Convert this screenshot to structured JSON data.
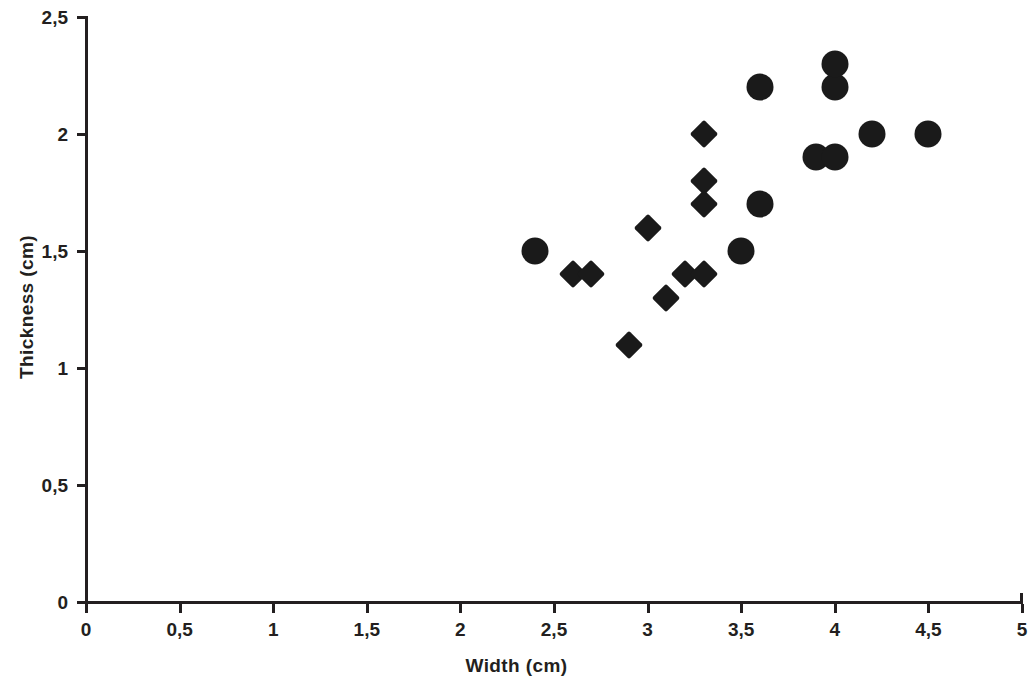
{
  "chart_data": {
    "type": "scatter",
    "title": "",
    "xlabel": "Width (cm)",
    "ylabel": "Thickness (cm)",
    "xlim": [
      0,
      5
    ],
    "ylim": [
      0,
      2.5
    ],
    "xticks": [
      "0",
      "0,5",
      "1",
      "1,5",
      "2",
      "2,5",
      "3",
      "3,5",
      "4",
      "4,5",
      "5"
    ],
    "xtick_values": [
      0,
      0.5,
      1,
      1.5,
      2,
      2.5,
      3,
      3.5,
      4,
      4.5,
      5
    ],
    "yticks": [
      "0",
      "0,5",
      "1",
      "1,5",
      "2",
      "2,5"
    ],
    "ytick_values": [
      0,
      0.5,
      1,
      1.5,
      2,
      2.5
    ],
    "grid": false,
    "legend": "none",
    "decimal_separator": ",",
    "marker_color": "#1a1a1a",
    "series": [
      {
        "name": "circle-series",
        "marker": "circle",
        "color": "#1a1a1a",
        "points": [
          {
            "x": 2.4,
            "y": 1.5
          },
          {
            "x": 3.5,
            "y": 1.5
          },
          {
            "x": 3.6,
            "y": 1.7
          },
          {
            "x": 3.6,
            "y": 2.2
          },
          {
            "x": 3.9,
            "y": 1.9
          },
          {
            "x": 4.0,
            "y": 1.9
          },
          {
            "x": 4.0,
            "y": 2.2
          },
          {
            "x": 4.0,
            "y": 2.3
          },
          {
            "x": 4.2,
            "y": 2.0
          },
          {
            "x": 4.5,
            "y": 2.0
          }
        ]
      },
      {
        "name": "diamond-series",
        "marker": "diamond",
        "color": "#1a1a1a",
        "points": [
          {
            "x": 2.6,
            "y": 1.4
          },
          {
            "x": 2.7,
            "y": 1.4
          },
          {
            "x": 2.9,
            "y": 1.1
          },
          {
            "x": 3.0,
            "y": 1.6
          },
          {
            "x": 3.1,
            "y": 1.3
          },
          {
            "x": 3.2,
            "y": 1.4
          },
          {
            "x": 3.3,
            "y": 1.4
          },
          {
            "x": 3.3,
            "y": 1.7
          },
          {
            "x": 3.3,
            "y": 1.8
          },
          {
            "x": 3.3,
            "y": 2.0
          }
        ]
      }
    ]
  }
}
